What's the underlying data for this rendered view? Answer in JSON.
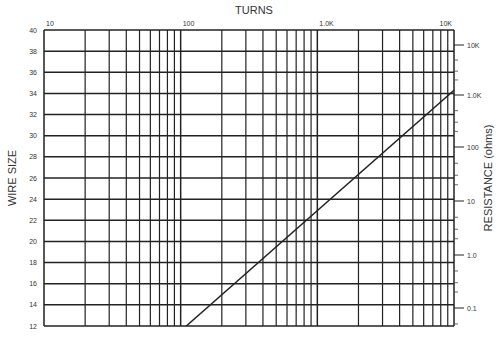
{
  "chart_data": {
    "type": "line",
    "title": "TURNS",
    "xlabel": "TURNS",
    "ylabel": "WIRE SIZE",
    "y2label": "RESISTANCE (ohms)",
    "x_scale": "log",
    "x_range": [
      10,
      10000
    ],
    "x_ticks": [
      "10",
      "100",
      "1.0K",
      "10K"
    ],
    "y_range": [
      12,
      40
    ],
    "y_ticks": [
      "40",
      "38",
      "36",
      "34",
      "32",
      "30",
      "28",
      "26",
      "24",
      "22",
      "20",
      "18",
      "16",
      "14",
      "12"
    ],
    "y2_scale": "log",
    "y2_ticks": [
      "10K",
      "1.0K",
      "100",
      "10",
      "1.0",
      "0.1"
    ],
    "grid": true,
    "series": [
      {
        "name": "resistance",
        "points": [
          {
            "turns": 110,
            "wire_size": 12
          },
          {
            "turns": 10000,
            "wire_size": 34.3
          }
        ]
      }
    ]
  },
  "labels": {
    "top_axis_title": "TURNS",
    "left_axis_title": "WIRE SIZE",
    "right_axis_title": "RESISTANCE (ohms)"
  }
}
